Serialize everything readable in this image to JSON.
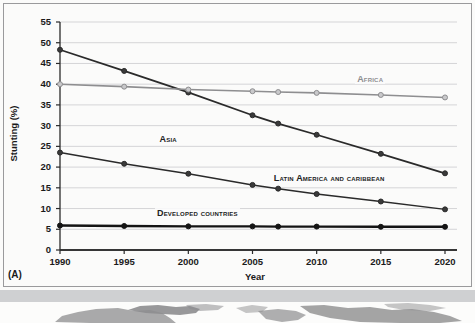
{
  "panel": {
    "label": "(A)"
  },
  "chart_data": {
    "type": "line",
    "title": "",
    "xlabel": "Year",
    "ylabel": "Stunting (%)",
    "xlim": [
      1990,
      2020
    ],
    "ylim": [
      0,
      55
    ],
    "ytick_step": 5,
    "grid": true,
    "legend_position": "inline-labels",
    "x": [
      1990,
      1995,
      2000,
      2005,
      2007,
      2010,
      2015,
      2020
    ],
    "xtick_labels": [
      "1990",
      "1995",
      "2000",
      "2005",
      "2010",
      "2015",
      "2020"
    ],
    "xticks": [
      1990,
      1995,
      2000,
      2005,
      2010,
      2015,
      2020
    ],
    "ytick_labels": [
      "0",
      "5",
      "10",
      "15",
      "20",
      "25",
      "30",
      "35",
      "40",
      "45",
      "50",
      "55"
    ],
    "yticks": [
      0,
      5,
      10,
      15,
      20,
      25,
      30,
      35,
      40,
      45,
      50,
      55
    ],
    "series": [
      {
        "name": "Asia",
        "label": "Asia",
        "color": "#2a2a2a",
        "marker_fill": "#3a3a3a",
        "line_width": 1.8,
        "values": [
          48.3,
          43.2,
          38.0,
          32.5,
          30.5,
          27.8,
          23.2,
          18.5
        ],
        "label_x": 1997.6,
        "label_y": 26.6
      },
      {
        "name": "Africa",
        "label": "Africa",
        "color": "#8e8e90",
        "marker_fill": "#c9c9cb",
        "line_width": 1.6,
        "values": [
          40.0,
          39.4,
          38.7,
          38.3,
          38.1,
          37.9,
          37.4,
          36.8
        ],
        "label_x": 2013.0,
        "label_y": 40.9
      },
      {
        "name": "Latin America and Caribbean",
        "label": "Latin America and caribbean",
        "color": "#2a2a2a",
        "marker_fill": "#3a3a3a",
        "line_width": 1.5,
        "values": [
          23.5,
          20.8,
          18.4,
          15.7,
          14.8,
          13.5,
          11.7,
          9.8
        ],
        "label_x": 2006.5,
        "label_y": 17.1
      },
      {
        "name": "Developed countries",
        "label": "Developed countries",
        "color": "#141414",
        "marker_fill": "#141414",
        "line_width": 2.4,
        "values": [
          5.9,
          5.8,
          5.7,
          5.7,
          5.65,
          5.65,
          5.6,
          5.6
        ],
        "label_x": 1997.4,
        "label_y": 8.6
      }
    ]
  }
}
